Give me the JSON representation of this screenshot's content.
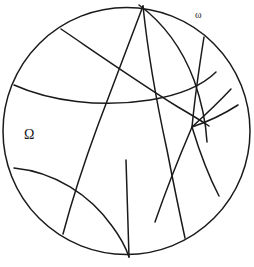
{
  "figure": {
    "type": "poincare-disk-diagram",
    "background_color": "#ffffff",
    "stroke_color": "#1a1a1a",
    "stroke_width": 1.5,
    "canvas": {
      "width": 254,
      "height": 267
    },
    "disk": {
      "cx": 126.5,
      "cy": 131.0,
      "r": 123.5
    },
    "labels": {
      "domain": "Ω",
      "ideal_vertex": "ω"
    },
    "geodesics": [
      {
        "name": "arc-upper-left-crossing",
        "d": "M 61,29 C 95,52 135,80 178,107 C 190,114 200,120 209,126"
      },
      {
        "name": "arc-left-horizontal",
        "d": "M 14,85 C 50,101 100,108 150,100 C 180,95 203,85 216,72"
      },
      {
        "name": "arc-top-to-bottom-right",
        "d": "M 143,6 C 147,45 155,95 167,150 C 174,186 180,215 185,238"
      },
      {
        "name": "arc-top-left-descending",
        "d": "M 143,6 C 131,38 115,80 98,125 C 84,163 72,200 63,234"
      },
      {
        "name": "arc-top-sweeping-right",
        "d": "M 139,5 C 162,22 182,48 194,80 C 202,103 206,124 207,142"
      },
      {
        "name": "arc-omega-to-center",
        "d": "M 204,37 C 200,62 195,96 192,127"
      },
      {
        "name": "arc-center-to-lower-right",
        "d": "M 192,127 C 199,150 208,175 219,196"
      },
      {
        "name": "arc-right-upper-fan",
        "d": "M 192,127 C 204,116 218,103 231,89"
      },
      {
        "name": "arc-right-lower-fan",
        "d": "M 192,127 C 207,122 224,114 238,105"
      },
      {
        "name": "arc-center-down-left",
        "d": "M 192,127 C 180,155 166,190 155,222"
      },
      {
        "name": "arc-bottom-left-lens",
        "d": "M 14,168 C 55,172 90,195 112,226 C 121,238 126,248 129,257"
      },
      {
        "name": "arc-lower-vertical",
        "d": "M 129,257 C 128,225 127,190 126,160"
      }
    ],
    "vertices": [
      {
        "name": "ideal-vertex-omega",
        "x": 204,
        "y": 37
      },
      {
        "name": "interior-node",
        "x": 192,
        "y": 127
      },
      {
        "name": "top-vertex",
        "x": 143,
        "y": 6
      }
    ]
  }
}
